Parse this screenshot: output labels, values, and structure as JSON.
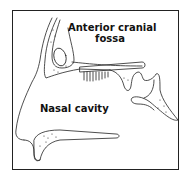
{
  "diagram": {
    "labels": {
      "anterior_cranial_fossa_line1": "Anterior cranial",
      "anterior_cranial_fossa_line2": "fossa",
      "nasal_cavity": "Nasal cavity"
    },
    "colors": {
      "stroke": "#222222",
      "background": "#ffffff"
    }
  }
}
